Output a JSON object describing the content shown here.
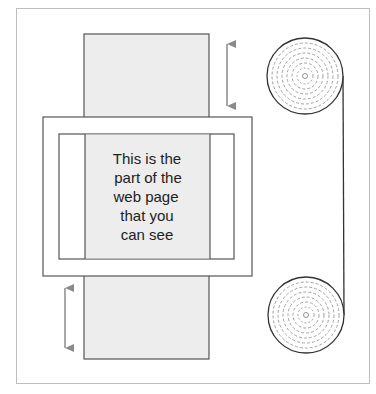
{
  "diagram": {
    "type": "scrolling-concept",
    "viewport_text": {
      "lines": [
        "This is the",
        "part of the",
        "web page",
        "that you",
        "can see"
      ]
    },
    "elements": {
      "web_page_strip": "long web page",
      "browser_window": "visible viewport frame",
      "arrow_top": "scroll up double arrow",
      "arrow_bottom": "scroll down double arrow",
      "roll_top": "scroll roll top",
      "roll_bottom": "scroll roll bottom"
    },
    "colors": {
      "frame": "#bdbdbd",
      "page_fill": "#ededed",
      "stroke": "#555555",
      "arrow": "#8a8a8a",
      "window_fill": "#ffffff"
    }
  }
}
